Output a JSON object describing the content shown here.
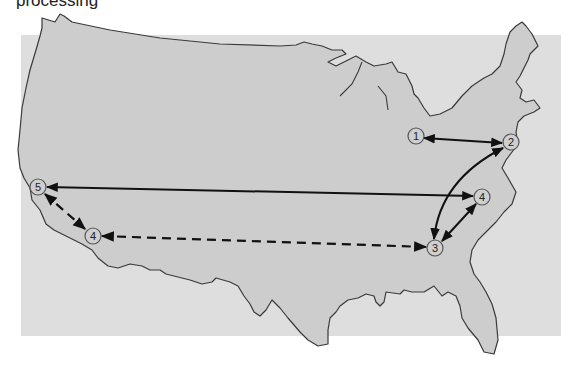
{
  "caption": "processing",
  "colors": {
    "background_panel": "#dedede",
    "map_fill": "#cdcdcd",
    "map_stroke": "#3a3a3a",
    "node_fill": "#cfcfcf",
    "node_stroke": "#555555",
    "arrow": "#111111"
  },
  "nodes": [
    {
      "id": "n1",
      "label": "1",
      "x": 416,
      "y": 136
    },
    {
      "id": "n2",
      "label": "2",
      "x": 511,
      "y": 142
    },
    {
      "id": "n4e",
      "label": "4",
      "x": 482,
      "y": 197
    },
    {
      "id": "n3",
      "label": "3",
      "x": 435,
      "y": 248
    },
    {
      "id": "n5",
      "label": "5",
      "x": 38,
      "y": 187
    },
    {
      "id": "n4w",
      "label": "4",
      "x": 93,
      "y": 236
    }
  ],
  "edges": [
    {
      "from": "1",
      "to": "2",
      "style": "solid",
      "arrows": "both"
    },
    {
      "from": "2",
      "to": "3",
      "style": "solid-curved",
      "arrows": "both"
    },
    {
      "from": "3",
      "to": "4 (east)",
      "style": "solid",
      "arrows": "both"
    },
    {
      "from": "4 (east)",
      "to": "5",
      "style": "solid",
      "arrows": "both"
    },
    {
      "from": "5",
      "to": "4 (west)",
      "style": "dashed",
      "arrows": "both"
    },
    {
      "from": "4 (west)",
      "to": "3",
      "style": "dashed",
      "arrows": "both"
    }
  ]
}
